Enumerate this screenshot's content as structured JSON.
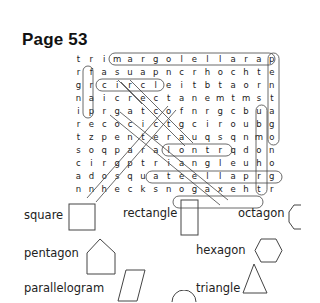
{
  "page": {
    "title": "Page 53"
  },
  "grid": [
    [
      "t",
      "r",
      "i",
      "m",
      "a",
      "r",
      "g",
      "o",
      "l",
      "e",
      "l",
      "l",
      "a",
      "r",
      "a",
      "p"
    ],
    [
      "r",
      "f",
      "a",
      "s",
      "u",
      "a",
      "p",
      "n",
      "c",
      "r",
      "h",
      "o",
      "c",
      "h",
      "t",
      "e"
    ],
    [
      "g",
      "r",
      "c",
      "i",
      "r",
      "c",
      "l",
      "e",
      "i",
      "t",
      "b",
      "t",
      "a",
      "o",
      "r",
      "n"
    ],
    [
      "n",
      "a",
      "i",
      "c",
      "r",
      "e",
      "c",
      "t",
      "a",
      "n",
      "e",
      "m",
      "t",
      "m",
      "s",
      "t"
    ],
    [
      "i",
      "p",
      "r",
      "g",
      "a",
      "t",
      "c",
      "o",
      "f",
      "n",
      "r",
      "g",
      "c",
      "b",
      "u",
      "a"
    ],
    [
      "r",
      "e",
      "c",
      "o",
      "c",
      "i",
      "c",
      "t",
      "g",
      "c",
      "i",
      "r",
      "o",
      "u",
      "b",
      "g"
    ],
    [
      "t",
      "z",
      "p",
      "e",
      "n",
      "t",
      "e",
      "r",
      "a",
      "u",
      "q",
      "s",
      "q",
      "n",
      "m",
      "o"
    ],
    [
      "s",
      "o",
      "q",
      "p",
      "a",
      "r",
      "a",
      "l",
      "o",
      "n",
      "t",
      "r",
      "q",
      "d",
      "o",
      "n"
    ],
    [
      "c",
      "i",
      "r",
      "g",
      "p",
      "t",
      "r",
      "i",
      "a",
      "n",
      "g",
      "l",
      "e",
      "u",
      "h",
      "o"
    ],
    [
      "a",
      "d",
      "o",
      "s",
      "q",
      "u",
      "a",
      "t",
      "e",
      "e",
      "l",
      "l",
      "a",
      "p",
      "r",
      "g"
    ],
    [
      "n",
      "n",
      "h",
      "e",
      "c",
      "k",
      "s",
      "n",
      "o",
      "g",
      "a",
      "x",
      "e",
      "h",
      "t",
      "r"
    ]
  ],
  "word_list": [
    {
      "label": "square",
      "shape": "square"
    },
    {
      "label": "rectangle",
      "shape": "rectangle"
    },
    {
      "label": "octagon",
      "shape": "octagon"
    },
    {
      "label": "pentagon",
      "shape": "pentagon"
    },
    {
      "label": "hexagon",
      "shape": "hexagon"
    },
    {
      "label": "parallelogram",
      "shape": "parallelogram"
    },
    {
      "label": "triangle",
      "shape": "triangle"
    },
    {
      "label": "",
      "shape": "circle"
    }
  ]
}
